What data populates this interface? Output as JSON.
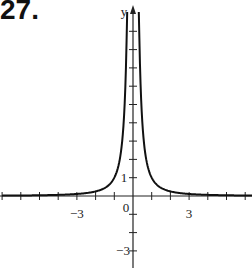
{
  "problem_label": "27.",
  "chart_data": {
    "type": "line",
    "title": "",
    "problem_number": "27.",
    "xlabel": "",
    "ylabel": "y",
    "function_description": "y = 1/x^2 (symmetric about y-axis, vertical asymptote at x = 0, horizontal asymptote y = 0)",
    "xlim": [
      -7,
      6.5
    ],
    "ylim": [
      -3.8,
      10
    ],
    "x_ticks_every": 1,
    "y_ticks_every": 1,
    "x_tick_labels": [
      {
        "value": -3,
        "text": "−3"
      },
      {
        "value": 0,
        "text": "0"
      },
      {
        "value": 3,
        "text": "3"
      }
    ],
    "y_tick_labels": [
      {
        "value": 1,
        "text": "1"
      },
      {
        "value": -3,
        "text": "−3"
      }
    ],
    "grid": false,
    "legend": null,
    "series": [
      {
        "name": "f(x)",
        "x": [
          -7,
          -5,
          -4,
          -3,
          -2,
          -1.5,
          -1,
          -0.75,
          -0.5,
          -0.4,
          -0.33,
          0.33,
          0.4,
          0.5,
          0.75,
          1,
          1.5,
          2,
          3,
          4,
          5,
          6.5
        ],
        "y": [
          0.02,
          0.04,
          0.06,
          0.11,
          0.25,
          0.44,
          1,
          1.78,
          4,
          6.25,
          9.2,
          9.2,
          6.25,
          4,
          1.78,
          1,
          0.44,
          0.25,
          0.11,
          0.06,
          0.04,
          0.02
        ]
      }
    ]
  },
  "axes": {
    "y_label": "y",
    "labels": {
      "x_neg3": "−3",
      "origin": "0",
      "x_pos3": "3",
      "y_pos1": "1",
      "y_neg3": "−3"
    }
  }
}
